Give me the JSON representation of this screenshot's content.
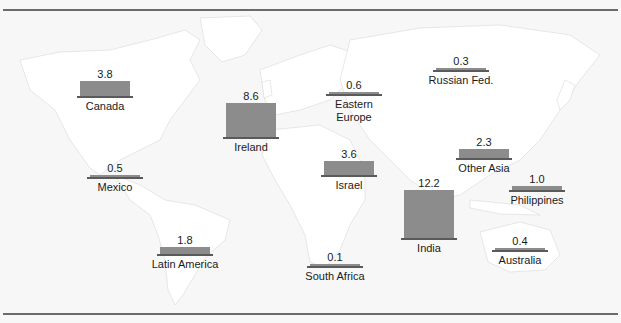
{
  "chart_data": {
    "type": "bar",
    "title": "",
    "xlabel": "",
    "ylabel": "",
    "units_note": "",
    "background": "world-map",
    "bar_color": "#8c8c8c",
    "base_color": "#5a5a5a",
    "series": [
      {
        "name": "Offshore value by region",
        "points": [
          {
            "region": "Canada",
            "label_lines": [
              "Canada"
            ],
            "value": 3.8,
            "value_label": "3.8"
          },
          {
            "region": "Ireland",
            "label_lines": [
              "Ireland"
            ],
            "value": 8.6,
            "value_label": "8.6"
          },
          {
            "region": "Eastern Europe",
            "label_lines": [
              "Eastern",
              "Europe"
            ],
            "value": 0.6,
            "value_label": "0.6"
          },
          {
            "region": "Russian Fed.",
            "label_lines": [
              "Russian Fed."
            ],
            "value": 0.3,
            "value_label": "0.3"
          },
          {
            "region": "Israel",
            "label_lines": [
              "Israel"
            ],
            "value": 3.6,
            "value_label": "3.6"
          },
          {
            "region": "Other Asia",
            "label_lines": [
              "Other Asia"
            ],
            "value": 2.3,
            "value_label": "2.3"
          },
          {
            "region": "Philippines",
            "label_lines": [
              "Philippines"
            ],
            "value": 1.0,
            "value_label": "1.0"
          },
          {
            "region": "India",
            "label_lines": [
              "India"
            ],
            "value": 12.2,
            "value_label": "12.2"
          },
          {
            "region": "Mexico",
            "label_lines": [
              "Mexico"
            ],
            "value": 0.5,
            "value_label": "0.5"
          },
          {
            "region": "Latin America",
            "label_lines": [
              "Latin America"
            ],
            "value": 1.8,
            "value_label": "1.8"
          },
          {
            "region": "South Africa",
            "label_lines": [
              "South Africa"
            ],
            "value": 0.1,
            "value_label": "0.1"
          },
          {
            "region": "Australia",
            "label_lines": [
              "Australia"
            ],
            "value": 0.4,
            "value_label": "0.4"
          }
        ]
      }
    ]
  }
}
